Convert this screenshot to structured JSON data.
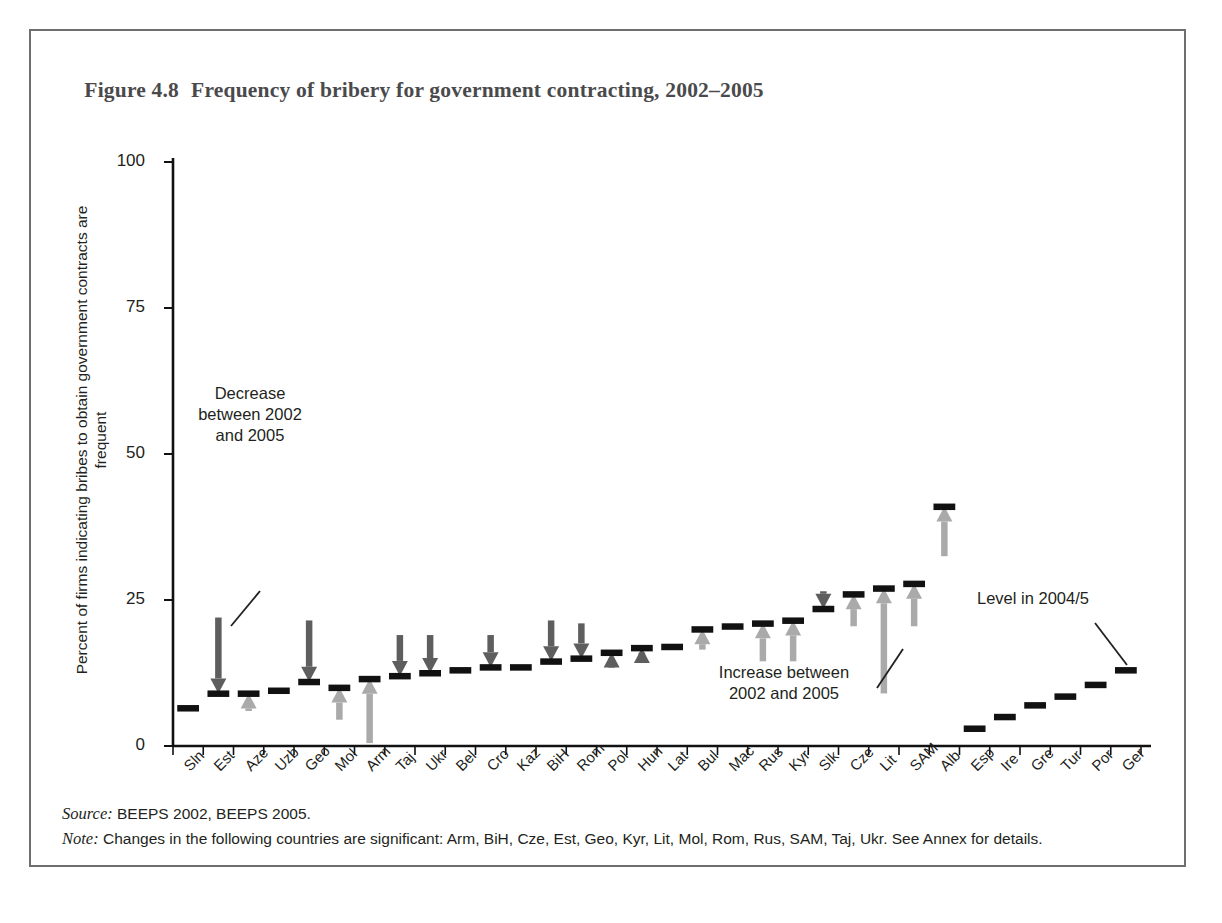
{
  "figure": {
    "number": "Figure 4.8",
    "title": "Frequency of bribery for government contracting, 2002–2005"
  },
  "annotations": {
    "decrease": "Decrease\nbetween 2002\nand 2005",
    "increase": "Increase between\n2002 and 2005",
    "level": "Level in 2004/5"
  },
  "footnotes": {
    "source_label": "Source:",
    "source_text": "BEEPS 2002, BEEPS 2005.",
    "note_label": "Note:",
    "note_text": "Changes in the following countries are significant: Arm, BiH, Cze, Est, Geo, Kyr, Lit, Mol, Rom, Rus, SAM, Taj, Ukr. See Annex for details."
  },
  "colors": {
    "level_mark": "#111111",
    "decrease_arrow": "#5e5e5e",
    "increase_arrow": "#aaaaaa",
    "axis": "#111111",
    "frame": "#6e6e70",
    "title": "#4a4a4c"
  },
  "chart_data": {
    "type": "bar",
    "title": "Frequency of bribery for government contracting, 2002–2005",
    "xlabel": "",
    "ylabel": "Percent of firms indicating bribes to obtain government contracts are frequent",
    "ylim": [
      0,
      100
    ],
    "yticks": [
      0,
      25,
      50,
      75,
      100
    ],
    "ytick_labels": [
      "0",
      "25",
      "50",
      "75",
      "100"
    ],
    "grid": false,
    "legend": "none",
    "categories": [
      "Sln",
      "Est",
      "Aze",
      "Uzb",
      "Geo",
      "Mol",
      "Arm",
      "Taj",
      "Ukr",
      "Bel",
      "Cro",
      "Kaz",
      "BiH",
      "Rom",
      "Pol",
      "Hun",
      "Lat",
      "Bul",
      "Mac",
      "Rus",
      "Kyr",
      "Slk",
      "Cze",
      "Lit",
      "SAM",
      "Alb",
      "Esp",
      "Ire",
      "Gre",
      "Tur",
      "Por",
      "Ger"
    ],
    "series": [
      {
        "name": "Level in 2004/5",
        "values": [
          6.5,
          9.0,
          9.0,
          9.5,
          11.0,
          10.0,
          11.5,
          12.0,
          12.5,
          13.0,
          13.5,
          13.5,
          14.5,
          15.0,
          16.0,
          16.8,
          17.0,
          20.0,
          20.5,
          21.0,
          21.5,
          23.5,
          26.0,
          27.0,
          27.8,
          41.0,
          3.0,
          5.0,
          7.0,
          8.5,
          10.5,
          13.0
        ]
      },
      {
        "name": "Level in 2002",
        "values": [
          null,
          22.0,
          6.0,
          null,
          21.5,
          4.5,
          0.5,
          19.0,
          19.0,
          null,
          19.0,
          null,
          21.5,
          21.0,
          15.0,
          16.0,
          null,
          16.5,
          null,
          14.5,
          14.5,
          26.5,
          20.5,
          9.0,
          20.5,
          32.5,
          null,
          null,
          null,
          null,
          null,
          null
        ]
      }
    ],
    "change_direction": [
      "none",
      "decrease",
      "increase",
      "none",
      "decrease",
      "increase",
      "increase",
      "decrease",
      "decrease",
      "none",
      "decrease",
      "none",
      "decrease",
      "decrease",
      "decrease",
      "decrease",
      "none",
      "increase",
      "none",
      "increase",
      "increase",
      "decrease",
      "increase",
      "increase",
      "increase",
      "increase",
      "none",
      "none",
      "none",
      "none",
      "none",
      "none"
    ],
    "significant_changes": [
      "Arm",
      "BiH",
      "Cze",
      "Est",
      "Geo",
      "Kyr",
      "Lit",
      "Mol",
      "Rom",
      "Rus",
      "SAM",
      "Taj",
      "Ukr"
    ]
  }
}
